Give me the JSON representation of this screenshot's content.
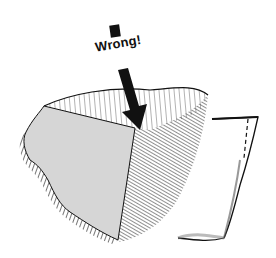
{
  "illustration": {
    "description": "Hand-drawn stone block with a splitting face; arrow pointing down onto the top edge labeled as incorrect",
    "label": "Wrong!",
    "colors": {
      "ink": "#111111",
      "face_gray": "#d6d6d6",
      "background": "#ffffff"
    }
  }
}
